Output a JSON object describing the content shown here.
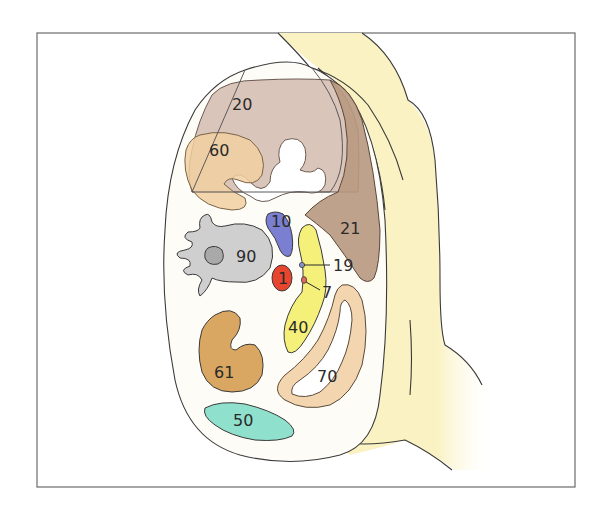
{
  "diagram": {
    "type": "anatomical-cross-section",
    "labels": [
      {
        "id": "20",
        "text": "20",
        "color": "#cdb3a6"
      },
      {
        "id": "21",
        "text": "21",
        "color": "#b89880"
      },
      {
        "id": "60",
        "text": "60",
        "color": "#f1cfa0"
      },
      {
        "id": "10",
        "text": "10",
        "color": "#7a7fd1"
      },
      {
        "id": "90",
        "text": "90",
        "color": "#cfcfcf"
      },
      {
        "id": "1",
        "text": "1",
        "color": "#e8452f"
      },
      {
        "id": "19",
        "text": "19",
        "color": "#8a93c8"
      },
      {
        "id": "7",
        "text": "7",
        "color": "#e06a60"
      },
      {
        "id": "40",
        "text": "40",
        "color": "#f5f07a"
      },
      {
        "id": "61",
        "text": "61",
        "color": "#d9a762"
      },
      {
        "id": "70",
        "text": "70",
        "color": "#f3d5b0"
      },
      {
        "id": "50",
        "text": "50",
        "color": "#8fe0cc"
      }
    ],
    "colors": {
      "body_fill": "#fefcf7",
      "fat_layer": "#faf2c2",
      "outline": "#3a3a3a",
      "frame": "#6b6b6b"
    }
  }
}
